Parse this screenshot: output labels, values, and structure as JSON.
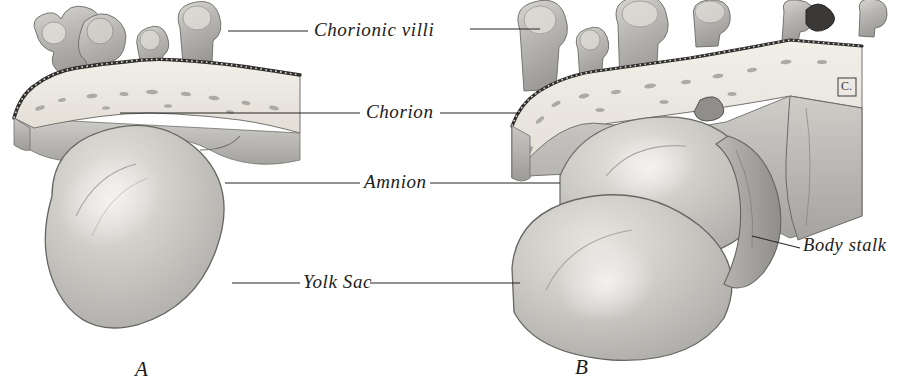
{
  "figure": {
    "kind": "anatomical-illustration",
    "background_color": "#ffffff",
    "ink_color": "#1c1c1c",
    "panels": [
      {
        "id": "A",
        "letter": "A"
      },
      {
        "id": "B",
        "letter": "B"
      }
    ],
    "labels": [
      {
        "id": "chorionic-villi",
        "text": "Chorionic villi"
      },
      {
        "id": "chorion",
        "text": "Chorion"
      },
      {
        "id": "amnion",
        "text": "Amnion"
      },
      {
        "id": "yolk-sac",
        "text": "Yolk Sac"
      },
      {
        "id": "body-stalk",
        "text": "Body stalk"
      }
    ],
    "signature": {
      "text": "C."
    }
  }
}
